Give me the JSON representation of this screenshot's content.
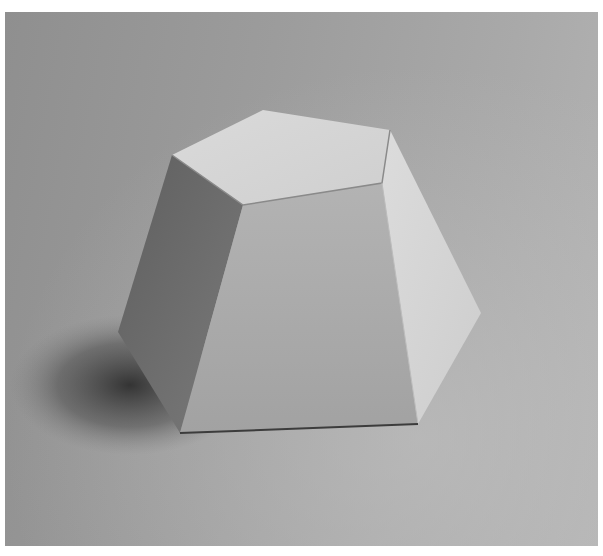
{
  "image": {
    "subject": "paper pentagonal frustum on grey background",
    "colors": {
      "background_light": "#b4b4b4",
      "background_dark": "#8f8f8f",
      "top_face": "#d6d6d6",
      "front_face": "#a8a8a8",
      "left_face": "#6e6e6e",
      "right_face": "#d2d2d2",
      "shadow": "#3a3a3a"
    }
  }
}
